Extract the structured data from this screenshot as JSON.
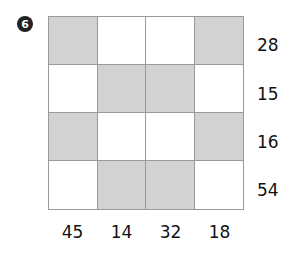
{
  "puzzle": {
    "number_badge": "6",
    "rows": [
      {
        "label": "28",
        "cells": [
          1,
          0,
          0,
          1
        ]
      },
      {
        "label": "15",
        "cells": [
          0,
          1,
          1,
          0
        ]
      },
      {
        "label": "16",
        "cells": [
          1,
          0,
          0,
          1
        ]
      },
      {
        "label": "54",
        "cells": [
          0,
          1,
          1,
          0
        ]
      }
    ],
    "column_labels": [
      "45",
      "14",
      "32",
      "18"
    ],
    "colors": {
      "shaded": "#d2d2d2",
      "unshaded": "#ffffff",
      "grid_line": "#9a9a9a"
    }
  }
}
